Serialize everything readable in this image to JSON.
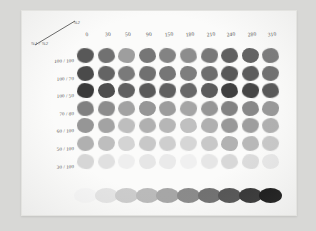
{
  "sheet": {
    "title": "Ink Density Test Sheet",
    "corner_header": {
      "top_label": "%2",
      "bottom_label": "%1 / %2"
    }
  },
  "chart_data": {
    "type": "heatmap",
    "xlabel": "",
    "ylabel": "",
    "grid": false,
    "legend": "none",
    "columns": [
      "0",
      "30",
      "50",
      "90",
      "150",
      "180",
      "210",
      "240",
      "280",
      "310"
    ],
    "rows": [
      "100 / 100",
      "100 / 70",
      "100 / 50",
      "70 / 80",
      "60 / 100",
      "50 / 100",
      "30 / 100"
    ],
    "series": [
      {
        "name": "100 / 100",
        "values": [
          88,
          113,
          158,
          118,
          131,
          141,
          120,
          96,
          99,
          122
        ]
      },
      {
        "name": "100 / 70",
        "values": [
          74,
          100,
          122,
          112,
          118,
          126,
          110,
          88,
          92,
          112
        ]
      },
      {
        "name": "100 / 50",
        "values": [
          58,
          78,
          96,
          90,
          96,
          104,
          92,
          64,
          70,
          88
        ]
      },
      {
        "name": "70 / 80",
        "values": [
          128,
          140,
          162,
          150,
          156,
          165,
          150,
          130,
          136,
          152
        ]
      },
      {
        "name": "60 / 100",
        "values": [
          150,
          163,
          190,
          176,
          182,
          192,
          176,
          152,
          158,
          176
        ]
      },
      {
        "name": "50 / 100",
        "values": [
          176,
          190,
          212,
          200,
          206,
          214,
          200,
          178,
          184,
          200
        ]
      },
      {
        "name": "30 / 100",
        "values": [
          214,
          224,
          238,
          230,
          234,
          240,
          230,
          216,
          220,
          232
        ]
      }
    ],
    "gradient_strip": {
      "name": "density-ramp",
      "values": [
        246,
        228,
        204,
        186,
        166,
        138,
        112,
        84,
        52,
        22
      ]
    }
  }
}
